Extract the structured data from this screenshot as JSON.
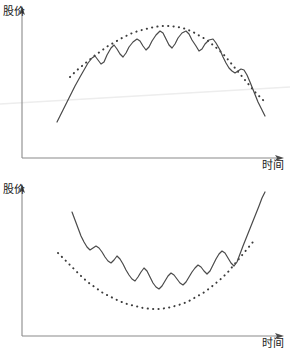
{
  "figure": {
    "background_color": "#ffffff",
    "width": 290,
    "height": 356,
    "caption": "",
    "line_color": "#4a4a4a",
    "axis_color": "#8a8a8a",
    "dot_color": "#3c3c3c",
    "artifact_color": "#ededed"
  },
  "charts": [
    {
      "id": "arc-top",
      "type": "line",
      "title": "",
      "ylabel": "股价",
      "xlabel": "时间",
      "pattern_name": "圆弧顶",
      "grid": false,
      "legend": false,
      "axis": {
        "origin_x": 22,
        "origin_y": 158,
        "x_end": 284,
        "y_top": 10
      },
      "series": [
        {
          "name": "股价走势",
          "style": "solid",
          "points": [
            [
              57,
              122
            ],
            [
              63,
              110
            ],
            [
              69,
              98
            ],
            [
              75,
              86
            ],
            [
              80,
              77
            ],
            [
              84,
              70
            ],
            [
              88,
              63
            ],
            [
              92,
              58
            ],
            [
              95,
              56
            ],
            [
              98,
              60
            ],
            [
              101,
              64
            ],
            [
              104,
              62
            ],
            [
              107,
              55
            ],
            [
              111,
              48
            ],
            [
              114,
              45
            ],
            [
              117,
              49
            ],
            [
              120,
              54
            ],
            [
              123,
              57
            ],
            [
              126,
              53
            ],
            [
              129,
              47
            ],
            [
              133,
              42
            ],
            [
              137,
              39
            ],
            [
              140,
              41
            ],
            [
              143,
              46
            ],
            [
              146,
              50
            ],
            [
              149,
              47
            ],
            [
              152,
              41
            ],
            [
              156,
              35
            ],
            [
              160,
              31
            ],
            [
              163,
              33
            ],
            [
              166,
              39
            ],
            [
              169,
              45
            ],
            [
              172,
              48
            ],
            [
              175,
              44
            ],
            [
              178,
              38
            ],
            [
              182,
              33
            ],
            [
              186,
              31
            ],
            [
              189,
              34
            ],
            [
              192,
              40
            ],
            [
              196,
              46
            ],
            [
              199,
              51
            ],
            [
              202,
              49
            ],
            [
              205,
              44
            ],
            [
              209,
              40
            ],
            [
              213,
              39
            ],
            [
              216,
              43
            ],
            [
              220,
              50
            ],
            [
              223,
              57
            ],
            [
              226,
              63
            ],
            [
              229,
              68
            ],
            [
              232,
              71
            ],
            [
              235,
              73
            ],
            [
              238,
              71
            ],
            [
              241,
              69
            ],
            [
              244,
              70
            ],
            [
              247,
              75
            ],
            [
              250,
              82
            ],
            [
              254,
              92
            ],
            [
              258,
              102
            ],
            [
              262,
              110
            ],
            [
              265,
              116
            ]
          ]
        },
        {
          "name": "圆弧顶包络线",
          "style": "dotted",
          "points": [
            [
              70,
              77
            ],
            [
              76,
              71
            ],
            [
              82,
              66
            ],
            [
              88,
              61
            ],
            [
              94,
              56
            ],
            [
              101,
              51
            ],
            [
              108,
              46
            ],
            [
              115,
              42
            ],
            [
              122,
              38
            ],
            [
              130,
              34
            ],
            [
              138,
              31
            ],
            [
              146,
              29
            ],
            [
              154,
              27
            ],
            [
              162,
              26
            ],
            [
              170,
              26
            ],
            [
              178,
              27
            ],
            [
              186,
              29
            ],
            [
              193,
              32
            ],
            [
              200,
              36
            ],
            [
              207,
              40
            ],
            [
              213,
              45
            ],
            [
              219,
              50
            ],
            [
              225,
              56
            ],
            [
              230,
              62
            ],
            [
              235,
              68
            ],
            [
              240,
              74
            ],
            [
              245,
              80
            ],
            [
              250,
              86
            ],
            [
              255,
              92
            ],
            [
              260,
              97
            ],
            [
              264,
              101
            ]
          ]
        }
      ],
      "artifact_line": {
        "name": "scan-artifact-diagonal",
        "x1": 0,
        "y1": 104,
        "x2": 290,
        "y2": 87
      }
    },
    {
      "id": "arc-bottom",
      "type": "line",
      "title": "",
      "ylabel": "股价",
      "xlabel": "时间",
      "pattern_name": "圆弧底",
      "grid": false,
      "legend": false,
      "axis": {
        "origin_x": 22,
        "origin_y": 158,
        "x_end": 284,
        "y_top": 10
      },
      "series": [
        {
          "name": "股价走势",
          "style": "solid",
          "points": [
            [
              72,
              34
            ],
            [
              75,
              42
            ],
            [
              78,
              50
            ],
            [
              81,
              58
            ],
            [
              84,
              64
            ],
            [
              87,
              69
            ],
            [
              90,
              72
            ],
            [
              93,
              70
            ],
            [
              96,
              68
            ],
            [
              99,
              70
            ],
            [
              102,
              74
            ],
            [
              105,
              79
            ],
            [
              108,
              83
            ],
            [
              111,
              85
            ],
            [
              114,
              82
            ],
            [
              117,
              78
            ],
            [
              120,
              81
            ],
            [
              123,
              86
            ],
            [
              126,
              92
            ],
            [
              129,
              97
            ],
            [
              132,
              101
            ],
            [
              135,
              103
            ],
            [
              138,
              99
            ],
            [
              141,
              94
            ],
            [
              144,
              90
            ],
            [
              147,
              93
            ],
            [
              150,
              99
            ],
            [
              153,
              105
            ],
            [
              156,
              109
            ],
            [
              159,
              111
            ],
            [
              162,
              108
            ],
            [
              165,
              103
            ],
            [
              168,
              98
            ],
            [
              171,
              95
            ],
            [
              174,
              97
            ],
            [
              177,
              101
            ],
            [
              180,
              105
            ],
            [
              183,
              107
            ],
            [
              186,
              104
            ],
            [
              189,
              99
            ],
            [
              192,
              94
            ],
            [
              195,
              90
            ],
            [
              198,
              87
            ],
            [
              201,
              89
            ],
            [
              204,
              93
            ],
            [
              207,
              96
            ],
            [
              210,
              93
            ],
            [
              213,
              87
            ],
            [
              216,
              81
            ],
            [
              219,
              76
            ],
            [
              222,
              73
            ],
            [
              225,
              75
            ],
            [
              228,
              80
            ],
            [
              231,
              85
            ],
            [
              234,
              88
            ],
            [
              237,
              84
            ],
            [
              240,
              76
            ],
            [
              243,
              68
            ],
            [
              247,
              58
            ],
            [
              251,
              48
            ],
            [
              255,
              38
            ],
            [
              259,
              28
            ],
            [
              262,
              20
            ],
            [
              265,
              14
            ]
          ]
        },
        {
          "name": "圆弧底包络线",
          "style": "dotted",
          "points": [
            [
              58,
              75
            ],
            [
              64,
              81
            ],
            [
              70,
              87
            ],
            [
              76,
              93
            ],
            [
              82,
              99
            ],
            [
              89,
              105
            ],
            [
              96,
              110
            ],
            [
              103,
              115
            ],
            [
              111,
              119
            ],
            [
              119,
              123
            ],
            [
              127,
              126
            ],
            [
              135,
              128
            ],
            [
              143,
              130
            ],
            [
              151,
              131
            ],
            [
              159,
              131
            ],
            [
              167,
              130
            ],
            [
              175,
              128
            ],
            [
              182,
              126
            ],
            [
              189,
              123
            ],
            [
              196,
              119
            ],
            [
              203,
              115
            ],
            [
              210,
              110
            ],
            [
              216,
              105
            ],
            [
              222,
              100
            ],
            [
              228,
              94
            ],
            [
              233,
              88
            ],
            [
              238,
              82
            ],
            [
              243,
              76
            ],
            [
              248,
              70
            ],
            [
              252,
              65
            ],
            [
              256,
              61
            ]
          ]
        }
      ],
      "artifact_line": null
    }
  ]
}
